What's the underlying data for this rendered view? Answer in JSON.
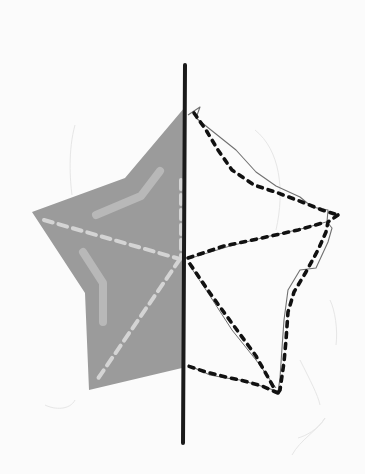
{
  "title": "Line symmetry exercise: half star reflected across a vertical mirror line",
  "colors": {
    "background": "#fbfbfb",
    "shaded_half": "#9a9a9a",
    "fold_lines": "#d2d2d2",
    "highlight_strokes": "#b6b6b6",
    "mirror_line": "#1a1a1a",
    "dotted_outline": "#111111",
    "pencil_trace": "#6e6e6e",
    "faint_marks": "#e4e4e4"
  },
  "mirror_axis": {
    "x1": 185,
    "y1": 65,
    "x2": 183,
    "y2": 443
  },
  "shaded_half_star": {
    "points": [
      [
        185,
        107
      ],
      [
        125,
        178
      ],
      [
        32,
        212
      ],
      [
        85,
        293
      ],
      [
        89,
        390
      ],
      [
        182,
        368
      ]
    ],
    "center": [
      182,
      259
    ]
  },
  "reflected_half_outline": {
    "points": [
      [
        190,
        113
      ],
      [
        240,
        188
      ],
      [
        328,
        222
      ],
      [
        338,
        215
      ],
      [
        324,
        230
      ],
      [
        286,
        296
      ],
      [
        278,
        393
      ],
      [
        244,
        382
      ],
      [
        186,
        365
      ]
    ],
    "center": [
      188,
      259
    ],
    "inner_spokes": [
      [
        [
          188,
          259
        ],
        [
          328,
          222
        ]
      ],
      [
        [
          188,
          259
        ],
        [
          278,
          393
        ]
      ]
    ]
  },
  "labels": {
    "mirror_line": "Mirror line",
    "shaded_half": "Given half of the star",
    "reflected_half": "Reflected half (dotted)"
  }
}
